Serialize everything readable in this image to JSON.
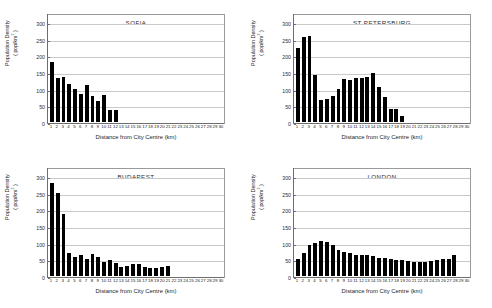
{
  "figure": {
    "axis_title_x": "Distance from City Centre (km)",
    "axis_title_y_line1": "Population Density",
    "axis_title_y_line2": "( pop/km2 )",
    "y_ticks": [
      "0",
      "50",
      "100",
      "150",
      "200",
      "250",
      "300"
    ],
    "x_ticks": [
      "1",
      "2",
      "3",
      "4",
      "5",
      "6",
      "7",
      "8",
      "9",
      "10",
      "11",
      "12",
      "13",
      "14",
      "15",
      "16",
      "17",
      "18",
      "19",
      "20",
      "21",
      "22",
      "23",
      "24",
      "25",
      "26",
      "27",
      "28",
      "29",
      "30"
    ],
    "bar_color": "#000000",
    "grid_color": "#c9c9c9",
    "frame_color": "#9a9a9a"
  },
  "chart_data": [
    {
      "type": "bar",
      "title": "SOFIA",
      "xlabel": "Distance from City Centre (km)",
      "ylabel": "Population Density ( pop/km2 )",
      "ylim": [
        0,
        300
      ],
      "xlim": [
        1,
        30
      ],
      "grid": true,
      "categories": [
        "1",
        "2",
        "3",
        "4",
        "5",
        "6",
        "7",
        "8",
        "9",
        "10",
        "11",
        "12",
        "13",
        "14",
        "15",
        "16",
        "17",
        "18",
        "19",
        "20",
        "21",
        "22",
        "23",
        "24",
        "25",
        "26",
        "27",
        "28",
        "29",
        "30"
      ],
      "values": [
        181,
        133,
        136,
        115,
        100,
        84,
        112,
        78,
        62,
        81,
        37,
        36,
        0,
        0,
        0,
        0,
        0,
        0,
        0,
        0,
        0,
        0,
        0,
        0,
        0,
        0,
        0,
        0,
        0,
        0
      ]
    },
    {
      "type": "bar",
      "title": "ST PETERSBURG",
      "xlabel": "Distance from City Centre (km)",
      "ylabel": "Population Density ( pop/km2 )",
      "ylim": [
        0,
        300
      ],
      "xlim": [
        1,
        30
      ],
      "grid": true,
      "categories": [
        "1",
        "2",
        "3",
        "4",
        "5",
        "6",
        "7",
        "8",
        "9",
        "10",
        "11",
        "12",
        "13",
        "14",
        "15",
        "16",
        "17",
        "18",
        "19",
        "20",
        "21",
        "22",
        "23",
        "24",
        "25",
        "26",
        "27",
        "28",
        "29",
        "30"
      ],
      "values": [
        221,
        256,
        259,
        140,
        67,
        68,
        78,
        99,
        128,
        127,
        133,
        133,
        135,
        147,
        104,
        74,
        38,
        38,
        19,
        0,
        0,
        0,
        0,
        0,
        0,
        0,
        0,
        0,
        0,
        0
      ]
    },
    {
      "type": "bar",
      "title": "BUDAPEST",
      "xlabel": "Distance from City Centre (km)",
      "ylabel": "Population Density ( pop/km2 )",
      "ylim": [
        0,
        300
      ],
      "xlim": [
        1,
        30
      ],
      "grid": true,
      "categories": [
        "1",
        "2",
        "3",
        "4",
        "5",
        "6",
        "7",
        "8",
        "9",
        "10",
        "11",
        "12",
        "13",
        "14",
        "15",
        "16",
        "17",
        "18",
        "19",
        "20",
        "21",
        "22",
        "23",
        "24",
        "25",
        "26",
        "27",
        "28",
        "29",
        "30"
      ],
      "values": [
        278,
        250,
        186,
        68,
        58,
        63,
        50,
        67,
        58,
        42,
        48,
        38,
        26,
        30,
        35,
        37,
        28,
        25,
        24,
        26,
        30,
        0,
        0,
        0,
        0,
        0,
        0,
        0,
        0,
        0
      ]
    },
    {
      "type": "bar",
      "title": "LONDON",
      "xlabel": "Distance from City Centre (km)",
      "ylabel": "Population Density ( pop/km2 )",
      "ylim": [
        0,
        300
      ],
      "xlim": [
        1,
        30
      ],
      "grid": true,
      "categories": [
        "1",
        "2",
        "3",
        "4",
        "5",
        "6",
        "7",
        "8",
        "9",
        "10",
        "11",
        "12",
        "13",
        "14",
        "15",
        "16",
        "17",
        "18",
        "19",
        "20",
        "21",
        "22",
        "23",
        "24",
        "25",
        "26",
        "27",
        "28",
        "29",
        "30"
      ],
      "values": [
        51,
        68,
        93,
        98,
        106,
        101,
        92,
        78,
        73,
        68,
        64,
        63,
        62,
        61,
        55,
        53,
        52,
        49,
        47,
        46,
        42,
        43,
        42,
        44,
        48,
        51,
        51,
        62,
        0,
        0
      ]
    }
  ]
}
